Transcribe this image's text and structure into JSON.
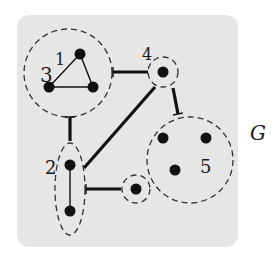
{
  "diagram": {
    "title_label": "G",
    "background_color": "#e6e6e6",
    "ink_color": "#111111",
    "box": {
      "x": 17,
      "y": 15,
      "width": 221,
      "height": 232,
      "radius": 12
    },
    "clusters": [
      {
        "id": "c1",
        "shape": "circle",
        "cx": 68,
        "cy": 73,
        "r": 44,
        "labels": [
          {
            "text": "3",
            "x": 40,
            "y": 82,
            "size": 20
          },
          {
            "text": "1",
            "x": 55,
            "y": 65,
            "size": 16
          }
        ]
      },
      {
        "id": "c4",
        "shape": "circle",
        "cx": 163,
        "cy": 72,
        "r": 15,
        "labels": [
          {
            "text": "4",
            "x": 142,
            "y": 60,
            "size": 16
          }
        ]
      },
      {
        "id": "c2",
        "shape": "ellipse",
        "cx": 70,
        "cy": 189,
        "rx": 15,
        "ry": 46,
        "labels": [
          {
            "text": "2",
            "x": 45,
            "y": 174,
            "size": 18
          }
        ]
      },
      {
        "id": "c6",
        "shape": "circle",
        "cx": 136,
        "cy": 189,
        "r": 14,
        "labels": []
      },
      {
        "id": "c5",
        "shape": "circle",
        "cx": 190,
        "cy": 160,
        "r": 43,
        "labels": [
          {
            "text": "5",
            "x": 200,
            "y": 173,
            "size": 18
          }
        ]
      }
    ],
    "vertices": [
      {
        "id": "v1",
        "x": 80,
        "y": 54
      },
      {
        "id": "v2",
        "x": 49,
        "y": 87
      },
      {
        "id": "v3",
        "x": 93,
        "y": 87
      },
      {
        "id": "v4",
        "x": 163,
        "y": 72
      },
      {
        "id": "v5",
        "x": 70,
        "y": 165
      },
      {
        "id": "v6",
        "x": 70,
        "y": 211
      },
      {
        "id": "v7",
        "x": 136,
        "y": 189
      },
      {
        "id": "v8",
        "x": 163,
        "y": 138
      },
      {
        "id": "v9",
        "x": 206,
        "y": 138
      },
      {
        "id": "v10",
        "x": 175,
        "y": 170
      }
    ],
    "thin_edges": [
      {
        "x1": 80,
        "y1": 54,
        "x2": 49,
        "y2": 87
      },
      {
        "x1": 80,
        "y1": 54,
        "x2": 93,
        "y2": 87
      },
      {
        "x1": 49,
        "y1": 87,
        "x2": 93,
        "y2": 87
      },
      {
        "x1": 70,
        "y1": 165,
        "x2": 70,
        "y2": 211
      }
    ],
    "thick_edges": [
      {
        "x1": 113,
        "y1": 72,
        "x2": 148,
        "y2": 72,
        "tick": "start"
      },
      {
        "x1": 70,
        "y1": 117,
        "x2": 70,
        "y2": 141,
        "tick": "start"
      },
      {
        "x1": 84,
        "y1": 168,
        "x2": 155,
        "y2": 87,
        "tick": "none"
      },
      {
        "x1": 173,
        "y1": 88,
        "x2": 178,
        "y2": 114,
        "tick": "end"
      },
      {
        "x1": 86,
        "y1": 189,
        "x2": 121,
        "y2": 189,
        "tick": "start"
      }
    ],
    "graph_label": {
      "text": "G",
      "x": 250,
      "y": 140,
      "size": 20
    }
  }
}
